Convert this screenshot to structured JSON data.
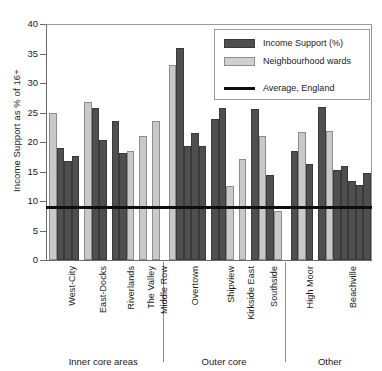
{
  "chart_data": {
    "type": "bar",
    "title": "",
    "xlabel": "",
    "ylabel": "Income Support as % of 16+",
    "ylim": [
      0,
      40
    ],
    "yticks": [
      0,
      5,
      10,
      15,
      20,
      25,
      30,
      35,
      40
    ],
    "grid": false,
    "legend_position": "top-right",
    "legend": [
      {
        "key": "income_support",
        "label": "Income Support (%)",
        "kind": "bar",
        "color": "#4f4f4f"
      },
      {
        "key": "neighbourhood_wards",
        "label": "Neighbourhood wards",
        "kind": "bar",
        "color": "#cfcfcf"
      },
      {
        "key": "average_england",
        "label": "Average, England",
        "kind": "line",
        "color": "#0d0d0d"
      }
    ],
    "annotations": [
      {
        "name": "average-england-line",
        "type": "hline",
        "value": 9.0,
        "label": "Average, England"
      }
    ],
    "groups": [
      {
        "name": "Inner core areas",
        "categories": [
          "West-City",
          "East-Docks",
          "Riverlands",
          "The Valley",
          "Middle Row"
        ]
      },
      {
        "name": "Outer core",
        "categories": [
          "Overtown",
          "Shipview",
          "Kirkside East",
          "Southside"
        ]
      },
      {
        "name": "Other",
        "categories": [
          "High Moor",
          "Beachville"
        ]
      }
    ],
    "categories": [
      "West-City",
      "East-Docks",
      "Riverlands",
      "The Valley",
      "Middle Row",
      "Overtown",
      "Shipview",
      "Kirkside East",
      "Southside",
      "High Moor",
      "Beachville"
    ],
    "bars": [
      {
        "group": "Inner core areas",
        "category": "West-City",
        "series": "neighbourhood_wards",
        "value": 25.0
      },
      {
        "group": "Inner core areas",
        "category": "West-City",
        "series": "income_support",
        "value": 19.0
      },
      {
        "group": "Inner core areas",
        "category": "West-City",
        "series": "income_support",
        "value": 16.8
      },
      {
        "group": "Inner core areas",
        "category": "West-City",
        "series": "income_support",
        "value": 17.6
      },
      {
        "group": "Inner core areas",
        "category": "East-Docks",
        "series": "neighbourhood_wards",
        "value": 26.7
      },
      {
        "group": "Inner core areas",
        "category": "East-Docks",
        "series": "income_support",
        "value": 25.8
      },
      {
        "group": "Inner core areas",
        "category": "East-Docks",
        "series": "income_support",
        "value": 20.3
      },
      {
        "group": "Inner core areas",
        "category": "Riverlands",
        "series": "income_support",
        "value": 23.6
      },
      {
        "group": "Inner core areas",
        "category": "Riverlands",
        "series": "income_support",
        "value": 18.1
      },
      {
        "group": "Inner core areas",
        "category": "Riverlands",
        "series": "neighbourhood_wards",
        "value": 18.5
      },
      {
        "group": "Inner core areas",
        "category": "The Valley",
        "series": "neighbourhood_wards",
        "value": 21.0
      },
      {
        "group": "Inner core areas",
        "category": "Middle Row",
        "series": "neighbourhood_wards",
        "value": 23.5
      },
      {
        "group": "Outer core",
        "category": "Overtown",
        "series": "neighbourhood_wards",
        "value": 33.1
      },
      {
        "group": "Outer core",
        "category": "Overtown",
        "series": "income_support",
        "value": 36.0
      },
      {
        "group": "Outer core",
        "category": "Overtown",
        "series": "income_support",
        "value": 19.4
      },
      {
        "group": "Outer core",
        "category": "Overtown",
        "series": "income_support",
        "value": 21.6
      },
      {
        "group": "Outer core",
        "category": "Overtown",
        "series": "income_support",
        "value": 19.4
      },
      {
        "group": "Outer core",
        "category": "Shipview",
        "series": "income_support",
        "value": 23.9
      },
      {
        "group": "Outer core",
        "category": "Shipview",
        "series": "income_support",
        "value": 25.7
      },
      {
        "group": "Outer core",
        "category": "Shipview",
        "series": "neighbourhood_wards",
        "value": 12.5
      },
      {
        "group": "Outer core",
        "category": "Kirkside East",
        "series": "neighbourhood_wards",
        "value": 17.2
      },
      {
        "group": "Outer core",
        "category": "Southside",
        "series": "income_support",
        "value": 25.6
      },
      {
        "group": "Outer core",
        "category": "Southside",
        "series": "neighbourhood_wards",
        "value": 21.1
      },
      {
        "group": "Outer core",
        "category": "Southside",
        "series": "income_support",
        "value": 14.4
      },
      {
        "group": "Outer core",
        "category": "Southside",
        "series": "neighbourhood_wards",
        "value": 8.3
      },
      {
        "group": "Other",
        "category": "High Moor",
        "series": "income_support",
        "value": 18.5
      },
      {
        "group": "Other",
        "category": "High Moor",
        "series": "neighbourhood_wards",
        "value": 21.7
      },
      {
        "group": "Other",
        "category": "High Moor",
        "series": "income_support",
        "value": 16.2
      },
      {
        "group": "Other",
        "category": "Beachville",
        "series": "income_support",
        "value": 26.0
      },
      {
        "group": "Other",
        "category": "Beachville",
        "series": "neighbourhood_wards",
        "value": 21.9
      },
      {
        "group": "Other",
        "category": "Beachville",
        "series": "income_support",
        "value": 15.3
      },
      {
        "group": "Other",
        "category": "Beachville",
        "series": "income_support",
        "value": 15.9
      },
      {
        "group": "Other",
        "category": "Beachville",
        "series": "income_support",
        "value": 13.4
      },
      {
        "group": "Other",
        "category": "Beachville",
        "series": "income_support",
        "value": 12.7
      },
      {
        "group": "Other",
        "category": "Beachville",
        "series": "income_support",
        "value": 14.8
      }
    ]
  },
  "colors": {
    "income_support": "#4f4f4f",
    "neighbourhood_wards": "#c9c9c9",
    "average_line": "#0d0d0d",
    "axis": "#6b6b6b",
    "background": "#ffffff"
  }
}
